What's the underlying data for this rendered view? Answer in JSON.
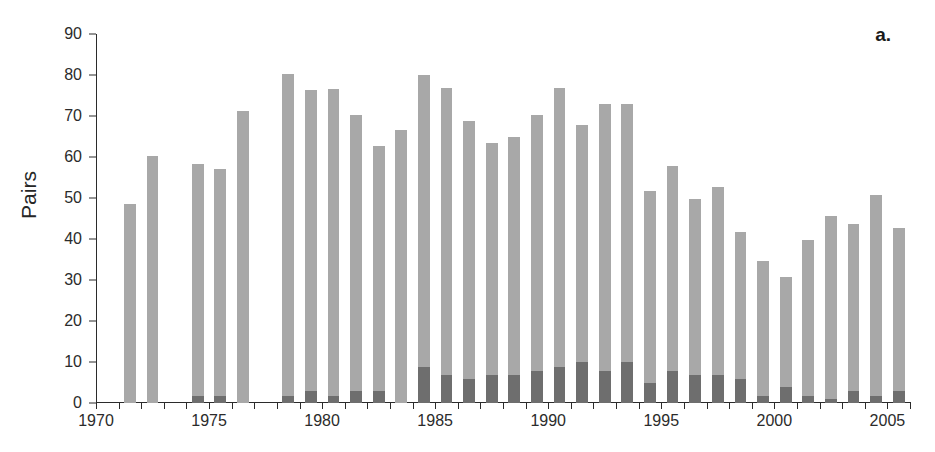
{
  "figure": {
    "panel_label": "a.",
    "ylabel": "Pairs",
    "xlabel": "",
    "background": "#ffffff",
    "total_color": "#a8a8a8",
    "sub_color": "#6e6e6e",
    "axis_color": "#2b2b2b"
  },
  "chart_data": {
    "type": "bar",
    "title": "",
    "subtitle": "",
    "xlabel": "",
    "ylabel": "Pairs",
    "xlim": [
      1970,
      2006
    ],
    "ylim": [
      0,
      90
    ],
    "ytick_labels": [
      "0",
      "10",
      "20",
      "30",
      "40",
      "50",
      "60",
      "70",
      "80",
      "90"
    ],
    "yticks": [
      0,
      10,
      20,
      30,
      40,
      50,
      60,
      70,
      80,
      90
    ],
    "xtick_labels": [
      "1970",
      "1975",
      "1980",
      "1985",
      "1990",
      "1995",
      "2000",
      "2005"
    ],
    "xticks_major": [
      1970,
      1975,
      1980,
      1985,
      1990,
      1995,
      2000,
      2005
    ],
    "xticks_minor_every": 1,
    "grid": false,
    "legend_position": "none",
    "stacked": true,
    "annotations": [
      "a."
    ],
    "categories": [
      1970,
      1971,
      1972,
      1973,
      1974,
      1975,
      1976,
      1977,
      1978,
      1979,
      1980,
      1981,
      1982,
      1983,
      1984,
      1985,
      1986,
      1987,
      1988,
      1989,
      1990,
      1991,
      1992,
      1993,
      1994,
      1995,
      1996,
      1997,
      1998,
      1999,
      2000,
      2001,
      2002,
      2003,
      2004,
      2005
    ],
    "series": [
      {
        "name": "Total pairs",
        "color": "#a8a8a8",
        "values": [
          0,
          48.5,
          60.3,
          0,
          58.3,
          57.0,
          71.3,
          0,
          80.3,
          76.3,
          76.7,
          70.3,
          62.7,
          66.7,
          79.9,
          76.8,
          68.8,
          63.3,
          64.8,
          70.3,
          76.8,
          67.8,
          72.9,
          72.9,
          51.8,
          57.8,
          49.8,
          52.8,
          41.8,
          34.7,
          30.8,
          39.8,
          45.7,
          43.7,
          50.8,
          42.8
        ]
      },
      {
        "name": "Dark sub-portion",
        "color": "#6e6e6e",
        "values": [
          0,
          0,
          0,
          0,
          1.8,
          1.8,
          0,
          0,
          1.8,
          2.9,
          1.8,
          2.9,
          2.9,
          0,
          8.9,
          6.8,
          5.9,
          6.8,
          6.8,
          7.9,
          8.9,
          9.9,
          7.9,
          9.9,
          4.9,
          7.9,
          6.8,
          6.8,
          5.9,
          1.8,
          3.9,
          1.8,
          0.9,
          2.9,
          1.8,
          2.9
        ]
      }
    ]
  }
}
